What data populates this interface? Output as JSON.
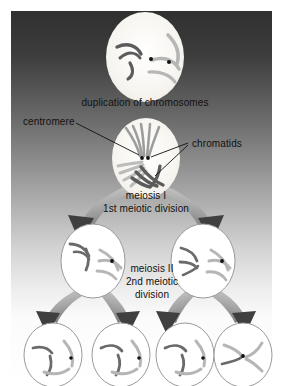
{
  "figure": {
    "background": {
      "gradient_top_color": "#3a3a3a",
      "gradient_bottom_color": "#ffffff",
      "frame_left": 11,
      "frame_top": 11,
      "frame_right": 272,
      "frame_bottom": 386
    },
    "colors": {
      "cell_fill_top": "#f4f2ec",
      "cell_outline": "#9a9a9a",
      "chromosome_dark": "#595959",
      "chromosome_light": "#b8b8b8",
      "centromere_dot": "#111111",
      "arrow_body": "#b0b0b0",
      "arrow_head": "#3f3f3f",
      "label_text": "#111111",
      "leader_line": "#111111"
    }
  },
  "labels": {
    "duplication": "duplication of chromosomes",
    "centromere": "centromere",
    "chromatids": "chromatids",
    "meiosis_one_line1": "meiosis I",
    "meiosis_one_line2": "1st meiotic division",
    "meiosis_two_line1": "meiosis II",
    "meiosis_two_line2": "2nd meiotic",
    "meiosis_two_line3": "division"
  },
  "cells": [
    {
      "id": "parent-cell",
      "stage": "duplication of chromosomes",
      "cx": 145,
      "cy": 57,
      "rx": 39,
      "ry": 45,
      "filled": true,
      "centromere_dots": 2
    },
    {
      "id": "metaphase-cell",
      "stage": "meiosis I",
      "cx": 146,
      "cy": 158,
      "rx": 34,
      "ry": 40,
      "filled": true,
      "centromere_dots": 2
    },
    {
      "id": "daughter-cell-left",
      "stage": "meiosis II",
      "cx": 93,
      "cy": 261,
      "rx": 32,
      "ry": 37,
      "filled": false,
      "centromere_dots": 1
    },
    {
      "id": "daughter-cell-right",
      "stage": "meiosis II",
      "cx": 203,
      "cy": 261,
      "rx": 32,
      "ry": 37,
      "filled": false,
      "centromere_dots": 1
    },
    {
      "id": "gamete-cell-1",
      "stage": "gamete",
      "cx": 53,
      "cy": 355,
      "rx": 29,
      "ry": 32,
      "filled": false,
      "centromere_dots": 1
    },
    {
      "id": "gamete-cell-2",
      "stage": "gamete",
      "cx": 121,
      "cy": 355,
      "rx": 29,
      "ry": 32,
      "filled": false,
      "centromere_dots": 1
    },
    {
      "id": "gamete-cell-3",
      "stage": "gamete",
      "cx": 185,
      "cy": 355,
      "rx": 29,
      "ry": 32,
      "filled": false,
      "centromere_dots": 1
    },
    {
      "id": "gamete-cell-4",
      "stage": "gamete",
      "cx": 243,
      "cy": 355,
      "rx": 29,
      "ry": 32,
      "filled": false,
      "centromere_dots": 1
    }
  ],
  "label_positions": {
    "duplication": {
      "x": 145,
      "y": 97
    },
    "centromere": {
      "x": 43,
      "y": 116
    },
    "chromatids": {
      "x": 198,
      "y": 144
    },
    "meiosis_one": {
      "x": 146,
      "y": 196
    },
    "meiosis_two": {
      "x": 152,
      "y": 265
    }
  }
}
